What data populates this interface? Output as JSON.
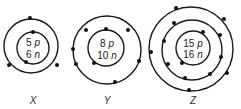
{
  "atoms": [
    {
      "label": "X",
      "protons": "5",
      "neutrons": "6",
      "p_unit": "p",
      "n_unit": "n",
      "shells": [
        {
          "electrons": 2
        },
        {
          "electrons": 3
        }
      ]
    },
    {
      "label": "Y",
      "protons": "8",
      "neutrons": "10",
      "p_unit": "p",
      "n_unit": "n",
      "shells": [
        {
          "electrons": 2
        },
        {
          "electrons": 6
        }
      ]
    },
    {
      "label": "Z",
      "protons": "15",
      "neutrons": "16",
      "p_unit": "p",
      "n_unit": "n",
      "shells": [
        {
          "electrons": 2
        },
        {
          "electrons": 8
        },
        {
          "electrons": 5
        }
      ]
    }
  ],
  "colors": {
    "stroke": "#1a1a1a",
    "electron": "#111111",
    "background": "#ffffff"
  }
}
